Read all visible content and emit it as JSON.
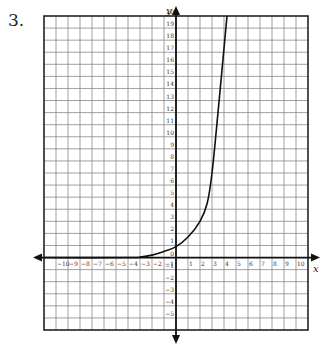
{
  "problem": {
    "number": "3."
  },
  "chart_data": {
    "type": "line",
    "title": "",
    "xlabel": "x",
    "ylabel": "y",
    "xlim": [
      -11,
      11
    ],
    "ylim": [
      -6,
      20
    ],
    "grid": true,
    "x_ticks": [
      -10,
      -9,
      -8,
      -7,
      -6,
      -5,
      -4,
      -3,
      -2,
      -1,
      1,
      2,
      3,
      4,
      5,
      6,
      7,
      8,
      9,
      10
    ],
    "y_ticks": [
      -5,
      -4,
      -3,
      -2,
      -1,
      0,
      1,
      2,
      3,
      4,
      5,
      6,
      7,
      8,
      9,
      10,
      11,
      12,
      13,
      14,
      15,
      16,
      17,
      18,
      19,
      20
    ],
    "series": [
      {
        "name": "curve",
        "x": [
          -11,
          -4,
          -3,
          -2,
          -1,
          0,
          1,
          2,
          2.6,
          3,
          3.5,
          4.25
        ],
        "y": [
          0,
          0,
          0.05,
          0.2,
          0.5,
          0.9,
          1.7,
          3,
          4.5,
          7,
          12,
          20
        ]
      }
    ],
    "colors": {
      "grid": "#888888",
      "axes": "#111111",
      "curve": "#111111"
    }
  }
}
